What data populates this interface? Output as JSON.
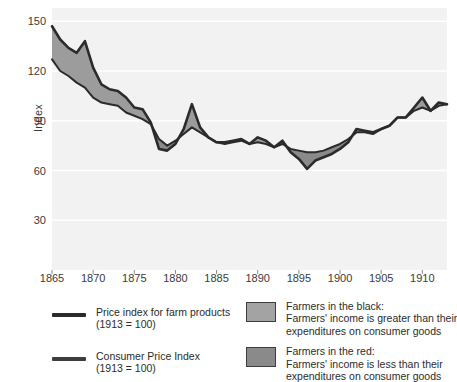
{
  "chart_data": {
    "type": "area",
    "title": "",
    "xlabel": "",
    "ylabel": "Index",
    "xlim": [
      1865,
      1913
    ],
    "ylim": [
      0,
      158
    ],
    "grid": true,
    "grid_axis": "y",
    "yticks": [
      150,
      120,
      90,
      60,
      30
    ],
    "xticks": [
      1865,
      1870,
      1875,
      1880,
      1885,
      1890,
      1895,
      1900,
      1905,
      1910
    ],
    "x": [
      1865,
      1866,
      1867,
      1868,
      1869,
      1870,
      1871,
      1872,
      1873,
      1874,
      1875,
      1876,
      1877,
      1878,
      1879,
      1880,
      1881,
      1882,
      1883,
      1884,
      1885,
      1886,
      1887,
      1888,
      1889,
      1890,
      1891,
      1892,
      1893,
      1894,
      1895,
      1896,
      1897,
      1898,
      1899,
      1900,
      1901,
      1902,
      1903,
      1904,
      1905,
      1906,
      1907,
      1908,
      1909,
      1910,
      1911,
      1912,
      1913
    ],
    "series": [
      {
        "name": "Price index for farm products (1913 = 100)",
        "color": "#2b2b2b",
        "values": [
          147,
          139,
          134,
          131,
          138,
          122,
          112,
          109,
          108,
          104,
          98,
          97,
          89,
          73,
          72,
          76,
          85,
          100,
          86,
          80,
          77,
          77,
          78,
          79,
          76,
          80,
          78,
          74,
          78,
          71,
          67,
          61,
          66,
          68,
          70,
          73,
          77,
          85,
          84,
          83,
          85,
          87,
          92,
          92,
          98,
          104,
          96,
          101,
          100
        ]
      },
      {
        "name": "Consumer Price Index (1913 = 100)",
        "color": "#2b2b2b",
        "values": [
          127,
          120,
          117,
          113,
          110,
          104,
          101,
          100,
          99,
          95,
          93,
          91,
          88,
          79,
          75,
          78,
          82,
          86,
          83,
          80,
          77,
          76,
          77,
          78,
          76,
          77,
          76,
          74,
          76,
          73,
          72,
          71,
          71,
          72,
          74,
          76,
          79,
          83,
          83,
          82,
          85,
          87,
          92,
          92,
          96,
          98,
          96,
          99,
          100
        ]
      }
    ],
    "fill_black": {
      "label": "Farmers in the black",
      "description": "Farmers' income is greater than their expenditures on consumer goods",
      "color": "#9c9c9c"
    },
    "fill_red": {
      "label": "Farmers in the red",
      "description": "Farmers' income is less than their expenditures on consumer goods",
      "color": "#8a8a8a"
    },
    "plot_background": "#f2f2f2",
    "gridline_color": "#ffffff"
  },
  "axis": {
    "y_title": "Index",
    "y_ticks": [
      "150",
      "120",
      "90",
      "60",
      "30"
    ],
    "x_ticks": [
      "1865",
      "1870",
      "1875",
      "1880",
      "1885",
      "1890",
      "1895",
      "1900",
      "1905",
      "1910"
    ]
  },
  "legend": {
    "entries": [
      {
        "kind": "line",
        "swatch_color": "#2b2b2b",
        "line1": "Price index for farm products",
        "line2": "(1913 = 100)"
      },
      {
        "kind": "line",
        "swatch_color": "#3d3d3d",
        "line1": "Consumer Price Index",
        "line2": "(1913 = 100)"
      },
      {
        "kind": "swatch",
        "swatch_color": "#a3a3a3",
        "line1": "Farmers in the black:",
        "line2": "Farmers' income is greater than their",
        "line3": "expenditures on consumer goods"
      },
      {
        "kind": "swatch",
        "swatch_color": "#8a8a8a",
        "line1": "Farmers in the red:",
        "line2": "Farmers' income is less than their",
        "line3": "expenditures on consumer goods"
      }
    ]
  }
}
